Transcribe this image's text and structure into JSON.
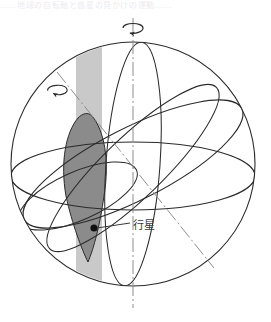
{
  "figure": {
    "kind": "celestial-sphere-diagram",
    "caption_top": "……地球の自転軸と惑星の見かけの運動……",
    "labels": {
      "planet": "行星"
    },
    "colors": {
      "outline": "#2b2b2b",
      "axis": "#8d8d8d",
      "lens_fill": "#8b8b8b",
      "band_fill": "#c9c9c9",
      "planet_dot": "#111111",
      "background": "#ffffff",
      "label_text": "#3a3a3a"
    },
    "geometry": {
      "sphere_center_x": 133,
      "sphere_center_y": 164,
      "sphere_radius": 122,
      "vertical_axis_top_y": 18,
      "vertical_axis_bottom_y": 308,
      "tilted_axis_deg": 28,
      "planet_dot_x": 94,
      "planet_dot_y": 228
    },
    "elements": [
      "outer-sphere-circle",
      "vertical-rotation-axis",
      "tilted-rotation-axis",
      "equator-ellipse",
      "ecliptic-ellipse",
      "orbit-ellipse",
      "meridian-ellipse",
      "small-left-ellipse",
      "retrograde-loop-region",
      "terminator-band",
      "planet-marker",
      "planet-leader-line",
      "axis-rotation-arrow-top",
      "axis-rotation-arrow-tilted"
    ]
  }
}
